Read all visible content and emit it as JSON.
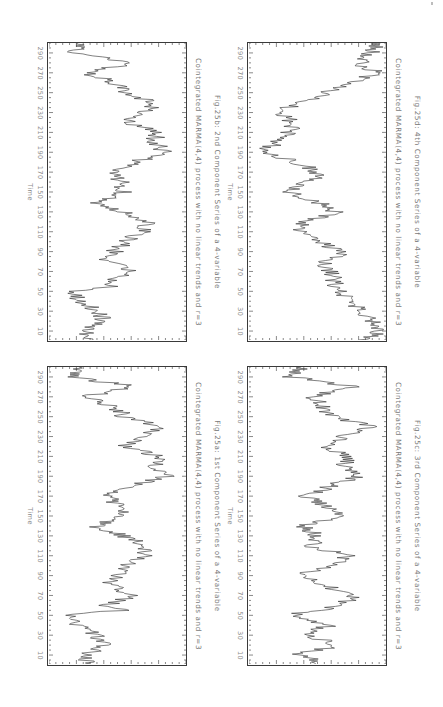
{
  "page": {
    "orientation": "rotated-90-clockwise"
  },
  "chart_data": [
    {
      "type": "line",
      "panel": "top-left",
      "title": "Fig.25b: 2nd Component Series of a 4-variable",
      "subtitle": "Cointegrated MARMA(4,4) process with no linear trends and r=3",
      "xlabel": "Time",
      "ylabel": "",
      "xticks": [
        10,
        30,
        50,
        70,
        90,
        110,
        130,
        150,
        170,
        190,
        210,
        230,
        250,
        270,
        290
      ],
      "xlim": [
        1,
        300
      ],
      "ylim": [
        0,
        100
      ],
      "y_units": "relative (no y tick labels shown)",
      "grid": false,
      "x": [
        1,
        10,
        20,
        30,
        40,
        50,
        55,
        60,
        70,
        80,
        90,
        100,
        110,
        120,
        130,
        140,
        150,
        160,
        170,
        180,
        190,
        200,
        210,
        220,
        230,
        240,
        250,
        260,
        270,
        280,
        290,
        300
      ],
      "values": [
        32,
        26,
        41,
        34,
        23,
        16,
        51,
        41,
        62,
        42,
        48,
        55,
        69,
        73,
        55,
        35,
        55,
        53,
        44,
        62,
        85,
        76,
        80,
        56,
        71,
        78,
        55,
        48,
        26,
        61,
        19,
        21
      ]
    },
    {
      "type": "line",
      "panel": "top-right",
      "title": "Fig.25d: 4th Component Series of a 4-variable",
      "subtitle": "Cointegrated MARMA(4,4) process with no linear trends and r=3",
      "xlabel": "Time",
      "ylabel": "",
      "xticks": [
        10,
        30,
        50,
        70,
        90,
        110,
        130,
        150,
        170,
        190,
        210,
        230,
        250,
        270,
        290
      ],
      "xlim": [
        1,
        300
      ],
      "ylim": [
        0,
        100
      ],
      "y_units": "relative (no y tick labels shown)",
      "grid": false,
      "x": [
        1,
        10,
        20,
        30,
        40,
        50,
        60,
        70,
        80,
        90,
        100,
        110,
        120,
        130,
        140,
        150,
        160,
        170,
        180,
        190,
        200,
        210,
        220,
        230,
        240,
        250,
        260,
        270,
        280,
        290,
        300
      ],
      "values": [
        87,
        96,
        91,
        84,
        73,
        66,
        62,
        59,
        54,
        69,
        51,
        37,
        41,
        62,
        51,
        30,
        44,
        51,
        34,
        11,
        19,
        30,
        34,
        19,
        37,
        56,
        73,
        94,
        80,
        89,
        96
      ]
    },
    {
      "type": "line",
      "panel": "bottom-left",
      "title": "Fig.25a: 1st Component Series of a 4-variable",
      "subtitle": "Cointegrated MARMA(4,4) process with no linear trends and r=3",
      "xlabel": "Time",
      "ylabel": "",
      "xticks": [
        10,
        30,
        50,
        70,
        90,
        110,
        130,
        150,
        170,
        190,
        210,
        230,
        250,
        270,
        290
      ],
      "xlim": [
        1,
        300
      ],
      "ylim": [
        0,
        100
      ],
      "y_units": "relative (no y tick labels shown)",
      "grid": false,
      "x": [
        1,
        10,
        20,
        30,
        40,
        50,
        55,
        60,
        70,
        80,
        90,
        100,
        110,
        120,
        130,
        140,
        150,
        160,
        170,
        180,
        190,
        200,
        210,
        220,
        230,
        240,
        250,
        260,
        270,
        280,
        290,
        300
      ],
      "values": [
        30,
        25,
        42,
        33,
        22,
        14,
        52,
        42,
        63,
        45,
        48,
        55,
        70,
        72,
        55,
        34,
        56,
        52,
        42,
        62,
        86,
        78,
        80,
        55,
        72,
        80,
        55,
        48,
        25,
        62,
        18,
        22
      ]
    },
    {
      "type": "line",
      "panel": "bottom-right",
      "title": "Fig.25c: 3rd Component Series of a 4-variable",
      "subtitle": "Cointegrated MARMA(4,4) process with no linear trends and r=3",
      "xlabel": "Time",
      "ylabel": "",
      "xticks": [
        10,
        30,
        50,
        70,
        90,
        110,
        130,
        150,
        170,
        190,
        210,
        230,
        250,
        270,
        290
      ],
      "xlim": [
        1,
        300
      ],
      "ylim": [
        0,
        100
      ],
      "y_units": "relative (no y tick labels shown)",
      "grid": false,
      "x": [
        1,
        10,
        20,
        30,
        40,
        50,
        60,
        70,
        80,
        90,
        100,
        110,
        120,
        130,
        140,
        150,
        160,
        170,
        180,
        190,
        200,
        210,
        220,
        230,
        240,
        250,
        260,
        270,
        280,
        290,
        300
      ],
      "values": [
        55,
        35,
        65,
        42,
        58,
        30,
        70,
        75,
        55,
        35,
        60,
        72,
        45,
        50,
        40,
        68,
        58,
        40,
        60,
        80,
        70,
        72,
        55,
        68,
        90,
        60,
        55,
        45,
        78,
        30,
        38
      ]
    }
  ],
  "style": {
    "line_color": "#2b2b2b",
    "frame_color": "#3a3a3a",
    "text_color": "#7a7a7a"
  }
}
